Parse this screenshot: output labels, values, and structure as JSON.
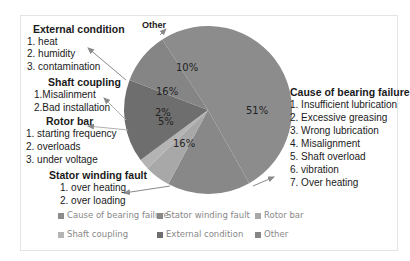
{
  "chart_data": {
    "type": "pie",
    "title": "",
    "categories": [
      "Cause of bearing failure",
      "Stator winding fault",
      "Rotor bar",
      "Shaft coupling",
      "External condition",
      "Other"
    ],
    "values": [
      51,
      16,
      5,
      2,
      16,
      10
    ],
    "labels": [
      "51%",
      "16%",
      "5%",
      "2%",
      "16%",
      "10%"
    ],
    "colors": [
      "#8c8c8c",
      "#888888",
      "#a8a8a8",
      "#b4b4b4",
      "#6e6e6e",
      "#858585"
    ],
    "legend_position": "bottom"
  },
  "annotations": {
    "external": {
      "title": "External condition",
      "items": [
        "1. heat",
        "2. humidity",
        "3.  contamination"
      ]
    },
    "shaft": {
      "title": "Shaft coupling",
      "items": [
        "1.Misalinment",
        "2.Bad installation"
      ]
    },
    "rotor": {
      "title": "Rotor bar",
      "items": [
        "1. starting frequency",
        "2. overloads",
        "3. under voltage"
      ]
    },
    "stator": {
      "title": "Stator winding fault",
      "items": [
        "1. over heating",
        "2. over loading"
      ]
    },
    "bearing": {
      "title": "Cause of bearing failure",
      "items": [
        "1. Insufficient lubrication",
        "2. Excessive greasing",
        "3. Wrong lubrication",
        "4. Misalignment",
        "5. Shaft overload",
        "6.  vibration",
        "7. Over heating"
      ]
    },
    "other": {
      "title": "Other"
    }
  },
  "legend": [
    {
      "label": "Cause of bearing failure",
      "color": "#8c8c8c"
    },
    {
      "label": "Stator winding fault",
      "color": "#888888"
    },
    {
      "label": "Rotor bar",
      "color": "#a8a8a8"
    },
    {
      "label": "Shaft coupling",
      "color": "#b4b4b4"
    },
    {
      "label": "External condition",
      "color": "#6e6e6e"
    },
    {
      "label": "Other",
      "color": "#858585"
    }
  ]
}
